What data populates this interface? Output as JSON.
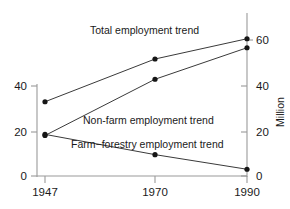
{
  "chart_data": {
    "type": "line",
    "title": "",
    "subtitle": "",
    "xlabel": "",
    "ylabel": "",
    "ylabel_right": "Million",
    "x": [
      1947,
      1970,
      1990
    ],
    "x_tick_labels": [
      "1947",
      "1970",
      "1990"
    ],
    "xlim": [
      1940,
      1994
    ],
    "left_axis": {
      "ticks": [
        0,
        20,
        40
      ],
      "tick_labels": [
        "0",
        "20",
        "40"
      ],
      "ylim": [
        0,
        65
      ],
      "label": ""
    },
    "right_axis": {
      "ticks": [
        0,
        20,
        40,
        60
      ],
      "tick_labels": [
        "0",
        "20",
        "40",
        "60"
      ],
      "ylim": [
        0,
        65
      ],
      "label": "Million"
    },
    "grid": false,
    "legend_position": "inline-annotations",
    "series": [
      {
        "name": "Total employment trend",
        "label": "Total employment trend",
        "values": [
          33,
          52,
          61
        ],
        "color": "#3a3a3a",
        "marker": "filled-circle"
      },
      {
        "name": "Non-farm employment trend",
        "label": "Non-farm employment trend",
        "values": [
          18,
          43,
          57
        ],
        "color": "#3a3a3a",
        "marker": "filled-circle"
      },
      {
        "name": "Farm-forestry employment trend",
        "label": "Farm−forestry employment trend",
        "values": [
          18.5,
          9.5,
          3
        ],
        "color": "#3a3a3a",
        "marker": "filled-circle"
      }
    ],
    "annotations": [
      {
        "text": "Total employment trend",
        "x_px": 90,
        "y_px": 34
      },
      {
        "text": "Non-farm employment trend",
        "x_px": 83,
        "y_px": 124
      },
      {
        "text": "Farm−forestry employment trend",
        "x_px": 71,
        "y_px": 148
      }
    ]
  }
}
